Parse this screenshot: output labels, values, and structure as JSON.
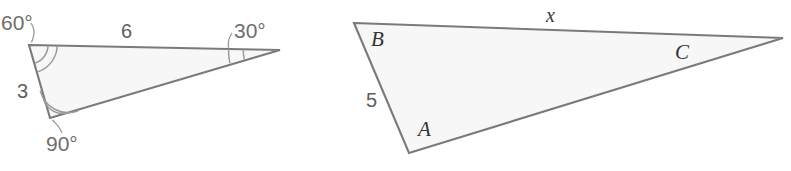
{
  "figure": {
    "background_color": "#ffffff",
    "stroke_color": "#7a7a7a",
    "fill_color": "#f7f7f7",
    "arc_color": "#9a9a9a",
    "text_color": "#5e5e5e"
  },
  "left_triangle": {
    "name": "reference-triangle",
    "angles": {
      "top_left": "60°",
      "right": "30°",
      "bottom": "90°"
    },
    "sides": {
      "top": "6",
      "left": "3"
    },
    "vertices": {
      "top_left": [
        29,
        45
      ],
      "right": [
        280,
        50
      ],
      "bottom": [
        50,
        118
      ]
    }
  },
  "right_triangle": {
    "name": "unknown-triangle",
    "vertex_labels": {
      "top_left": "B",
      "bottom_left": "A",
      "right": "C"
    },
    "sides": {
      "top": "x",
      "left": "5"
    },
    "vertices": {
      "top_left": [
        354,
        23
      ],
      "bottom_left": [
        409,
        153
      ],
      "right": [
        783,
        38
      ]
    }
  }
}
